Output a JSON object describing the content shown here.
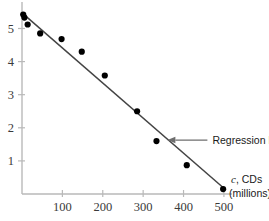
{
  "chart_data": {
    "type": "scatter",
    "title": "",
    "subtitle": "",
    "xlabel": "c, CDs (millions)",
    "xlabel_symbol": "c",
    "xlabel_rest": ", CDs",
    "xlabel_units": "(millions)",
    "ylabel": "",
    "xlim": [
      0,
      520
    ],
    "ylim": [
      0,
      5.8
    ],
    "xticks": [
      100,
      200,
      300,
      400,
      500
    ],
    "xtick_labels": [
      "100",
      "200",
      "300",
      "400",
      "500"
    ],
    "yticks": [
      1,
      2,
      3,
      4,
      5
    ],
    "ytick_labels": [
      "1",
      "2",
      "3",
      "4",
      "5"
    ],
    "grid": false,
    "legend": false,
    "points": [
      {
        "x": 3,
        "y": 5.42
      },
      {
        "x": 6,
        "y": 5.33
      },
      {
        "x": 14,
        "y": 5.12
      },
      {
        "x": 45,
        "y": 4.85
      },
      {
        "x": 98,
        "y": 4.68
      },
      {
        "x": 148,
        "y": 4.3
      },
      {
        "x": 205,
        "y": 3.58
      },
      {
        "x": 285,
        "y": 2.5
      },
      {
        "x": 333,
        "y": 1.6
      },
      {
        "x": 408,
        "y": 0.87
      },
      {
        "x": 498,
        "y": 0.15
      }
    ],
    "series": [
      {
        "name": "Regression line",
        "type": "line",
        "x": [
          0,
          505
        ],
        "y": [
          5.47,
          0.12
        ]
      }
    ],
    "annotations": [
      {
        "name": "regression-line",
        "text": "Regression line",
        "arrow": "left",
        "target_x": 360,
        "target_y": 1.63
      }
    ],
    "colors": {
      "point": "#000000",
      "line": "#444444",
      "axis": "#b9b9b9",
      "text": "#1a1a1a",
      "ticklabel": "#3a3a3a",
      "arrow": "#6e6e6e",
      "background": "#ffffff"
    }
  }
}
